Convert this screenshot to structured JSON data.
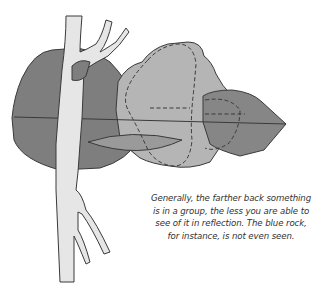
{
  "illustration": {
    "subject": "tree trunk with branches in front of grey rock group, reflected below",
    "colors": {
      "background": "#ffffff",
      "dark_rock": "#7f7f7f",
      "mid_rock": "#9a9a9a",
      "light_rock": "#b9b9b9",
      "right_rock": "#858585",
      "trunk": "#e6e6e6",
      "outline": "#3a3a3a"
    }
  },
  "caption": {
    "lines": [
      "Generally, the farther back something",
      "is in a group, the less you are able to",
      "see of it in reflection. The blue rock,",
      "for instance, is not even seen."
    ]
  }
}
